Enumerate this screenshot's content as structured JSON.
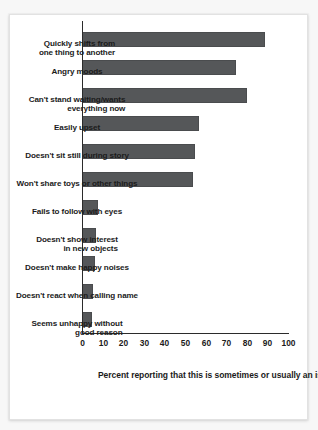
{
  "chart_data": {
    "type": "bar",
    "title": "",
    "subtitle": "",
    "orientation": "rotated-90-clockwise",
    "xlabel": "",
    "ylabel": "Percent reporting that this is sometimes or usually an issue",
    "ylim": [
      0,
      100
    ],
    "ytick_step": 10,
    "grid": false,
    "legend": false,
    "bar_color": "#555759",
    "axis_color": "#2b2b2b",
    "text_color": "#1b1b1b",
    "categories": [
      "Quickly shifts from one thing to another",
      "Angry moods",
      "Can't stand waiting/wants everything now",
      "Easily upset",
      "Doesn't sit still during story",
      "Won't share toys or other things",
      "Fails to follow with eyes",
      "Doesn't show interest in new objects",
      "Doesn't make happy noises",
      "Doesn't react when calling name",
      "Seems unhappy without good reason"
    ],
    "category_lines": [
      [
        "Quickly shifts from",
        "one thing to another"
      ],
      [
        "Angry moods",
        ""
      ],
      [
        "Can't stand waiting/wants",
        "everything now"
      ],
      [
        "Easily upset",
        ""
      ],
      [
        "Doesn't sit still during story",
        ""
      ],
      [
        "Won't share toys or other things",
        ""
      ],
      [
        "Fails to follow with eyes",
        ""
      ],
      [
        "Doesn't show interest",
        "in new objects"
      ],
      [
        "Doesn't make happy noises",
        ""
      ],
      [
        "Doesn't react when calling name",
        ""
      ],
      [
        "Seems unhappy without",
        "good reason"
      ]
    ],
    "values": [
      89,
      75,
      80,
      57,
      55,
      54,
      8,
      7,
      6.5,
      5.5,
      5
    ],
    "yticks": [
      0,
      10,
      20,
      30,
      40,
      50,
      60,
      70,
      80,
      90,
      100
    ],
    "ytick_labels": [
      "0",
      "10",
      "20",
      "30",
      "40",
      "50",
      "60",
      "70",
      "80",
      "90",
      "100"
    ]
  }
}
